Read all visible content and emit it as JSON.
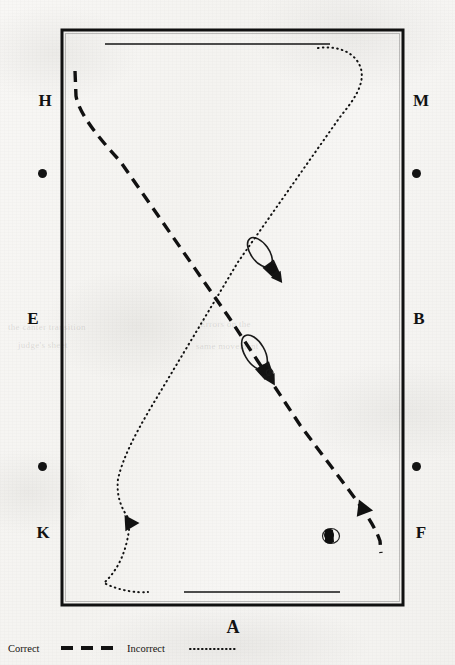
{
  "figure": {
    "kind": "dressage-arena-trajectory-diagram",
    "arena": {
      "border_color": "#111111",
      "centerline_markers": [
        {
          "name": "top-centerline",
          "x1": 105,
          "y1": 44,
          "x2": 330,
          "y2": 44
        },
        {
          "name": "bottom-centerline",
          "x1": 184,
          "y1": 592,
          "x2": 340,
          "y2": 592
        }
      ]
    },
    "markers": {
      "left": [
        {
          "name": "H",
          "label": "H",
          "x": 44,
          "y": 100
        },
        {
          "name": "left-dot-upper",
          "label": "",
          "x": 42,
          "y": 173
        },
        {
          "name": "E",
          "label": "E",
          "x": 32,
          "y": 318
        },
        {
          "name": "left-dot-lower",
          "label": "",
          "x": 42,
          "y": 466
        },
        {
          "name": "K",
          "label": "K",
          "x": 42,
          "y": 532
        }
      ],
      "right": [
        {
          "name": "M",
          "label": "M",
          "x": 420,
          "y": 100
        },
        {
          "name": "right-dot-upper",
          "label": "",
          "x": 416,
          "y": 173
        },
        {
          "name": "B",
          "label": "B",
          "x": 418,
          "y": 318
        },
        {
          "name": "right-dot-lower",
          "label": "",
          "x": 416,
          "y": 466
        },
        {
          "name": "F",
          "label": "F",
          "x": 420,
          "y": 532
        }
      ],
      "bottom": [
        {
          "name": "A",
          "label": "A",
          "x": 232,
          "y": 628
        }
      ]
    },
    "legend": [
      {
        "name": "correct",
        "label": "Correct",
        "style": "dashed",
        "color": "#111111"
      },
      {
        "name": "incorrect",
        "label": "Incorrect",
        "style": "dotted",
        "color": "#111111"
      }
    ],
    "paths": [
      {
        "name": "correct-path",
        "style": "dashed",
        "description": "Dashed trajectory from H down across the diagonal to F",
        "points": "M 75,72 L 76,95 C 80,112 96,134 120,160 L 228,316 L 300,424 L 356,500 C 368,516 375,528 379,540 L 380,552"
      },
      {
        "name": "incorrect-path",
        "style": "dotted",
        "description": "Dotted trajectory from the top centerline near M down the diagonal to K",
        "points": "M 318,48 C 340,46 356,54 360,68 C 364,84 354,100 340,116 L 238,262 L 150,408 C 136,432 124,456 118,478 L 128,520 C 126,548 118,568 104,582 C 122,590 138,592 148,592"
      }
    ],
    "riders": [
      {
        "name": "rider-figure-upper",
        "x": 264,
        "y": 258,
        "rotation": -36,
        "on_path": "incorrect-path"
      },
      {
        "name": "rider-figure-lower",
        "x": 259,
        "y": 360,
        "rotation": -30,
        "on_path": "correct-path"
      },
      {
        "name": "rider-figure-head-on",
        "x": 331,
        "y": 536,
        "rotation": 0,
        "on_path": "correct-path"
      }
    ],
    "arrowheads": [
      {
        "name": "arrowhead-correct-lower-right",
        "x": 366,
        "y": 505,
        "rotation": 128
      },
      {
        "name": "arrowhead-incorrect-lower-left",
        "x": 132,
        "y": 519,
        "rotation": 118
      }
    ],
    "ghost_text": [
      {
        "text": "the canter transition",
        "x": 8,
        "y": 330
      },
      {
        "text": "Errors on the",
        "x": 200,
        "y": 327
      },
      {
        "text": "judge's sheet",
        "x": 18,
        "y": 348
      },
      {
        "text": "same movement",
        "x": 196,
        "y": 349
      }
    ]
  }
}
